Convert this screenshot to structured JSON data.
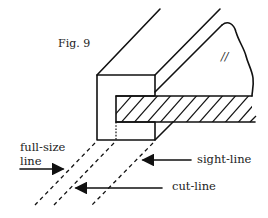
{
  "figure": {
    "caption": "Fig. 9",
    "grain_mark": "//",
    "labels": {
      "full_size_line": [
        "full-size",
        "line"
      ],
      "sight_line": "sight-line",
      "cut_line": "cut-line"
    }
  }
}
